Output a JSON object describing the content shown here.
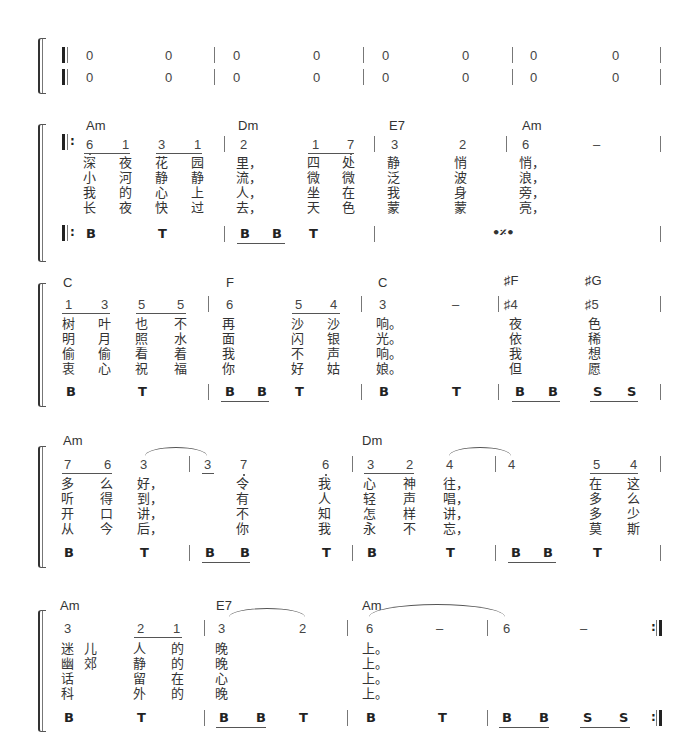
{
  "intro": {
    "row1": [
      "0",
      "0",
      "0",
      "0",
      "0",
      "0",
      "0",
      "0"
    ],
    "row2": [
      "0",
      "0",
      "0",
      "0",
      "0",
      "0",
      "0",
      "0"
    ]
  },
  "system1": {
    "chords": [
      "Am",
      "Dm",
      "E7",
      "Am"
    ],
    "notes": [
      "6",
      "1",
      "3",
      "1",
      "2",
      "1",
      "7",
      "3",
      "2",
      "6",
      "–"
    ],
    "lyrics": [
      [
        "深",
        "夜",
        "花",
        "园",
        "里，",
        "四",
        "处",
        "静",
        "悄",
        "悄，"
      ],
      [
        "小",
        "河",
        "静",
        "静",
        "流，",
        "微",
        "微",
        "泛",
        "波",
        "浪，"
      ],
      [
        "我",
        "的",
        "心",
        "上",
        "人，",
        "坐",
        "在",
        "我",
        "身",
        "旁，"
      ],
      [
        "长",
        "夜",
        "快",
        "过",
        "去，",
        "天",
        "色",
        "蒙",
        "蒙",
        "亮，"
      ]
    ],
    "perc": [
      "B",
      "T",
      "B",
      "B",
      "T"
    ],
    "simile": "•𝄎•"
  },
  "system2": {
    "chords": [
      "C",
      "F",
      "C",
      "♯F",
      "♯G"
    ],
    "notes": [
      "1",
      "3",
      "5",
      "5",
      "6",
      "5",
      "4",
      "3",
      "–",
      "♯4",
      "♯5"
    ],
    "lyrics": [
      [
        "树",
        "叶",
        "也",
        "不",
        "再",
        "沙",
        "沙",
        "响。",
        "夜",
        "色"
      ],
      [
        "明",
        "月",
        "照",
        "水",
        "面",
        "闪",
        "银",
        "光。",
        "依",
        "稀"
      ],
      [
        "偷",
        "偷",
        "看",
        "着",
        "我",
        "不",
        "声",
        "响。",
        "我",
        "想"
      ],
      [
        "衷",
        "心",
        "祝",
        "福",
        "你",
        "好",
        "姑",
        "娘。",
        "但",
        "愿"
      ]
    ],
    "perc": [
      "B",
      "T",
      "B",
      "B",
      "T",
      "B",
      "T",
      "B",
      "B",
      "S",
      "S"
    ]
  },
  "system3": {
    "chords": [
      "Am",
      "Dm"
    ],
    "notes": [
      "7",
      "6",
      "3",
      "3",
      "7",
      "6",
      "3",
      "2",
      "4",
      "4",
      "5",
      "4"
    ],
    "lyrics": [
      [
        "多",
        "么",
        "好，",
        "令",
        "我",
        "心",
        "神",
        "往，",
        "在",
        "这"
      ],
      [
        "听",
        "得",
        "到，",
        "有",
        "人",
        "轻",
        "声",
        "唱，",
        "多",
        "么"
      ],
      [
        "开",
        "口",
        "讲，",
        "不",
        "知",
        "怎",
        "样",
        "讲，",
        "多",
        "少"
      ],
      [
        "从",
        "今",
        "后，",
        "你",
        "我",
        "永",
        "不",
        "忘，",
        "莫",
        "斯"
      ]
    ],
    "perc": [
      "B",
      "T",
      "B",
      "B",
      "T",
      "B",
      "T",
      "B",
      "B",
      "T"
    ]
  },
  "system4": {
    "chords": [
      "Am",
      "E7",
      "Am"
    ],
    "notes": [
      "3",
      "2",
      "1",
      "3",
      "2",
      "6",
      "–",
      "6",
      "–"
    ],
    "lyrics": [
      [
        "迷",
        "",
        "人",
        "的",
        "晚",
        "上。"
      ],
      [
        "幽",
        "",
        "静",
        "的",
        "晚",
        "上。"
      ],
      [
        "话",
        "儿",
        "留",
        "在",
        "心",
        "上。"
      ],
      [
        "科",
        "郊",
        "外",
        "的",
        "晚",
        "上。"
      ]
    ],
    "perc": [
      "B",
      "T",
      "B",
      "B",
      "T",
      "B",
      "T",
      "B",
      "B",
      "S",
      "S"
    ]
  }
}
